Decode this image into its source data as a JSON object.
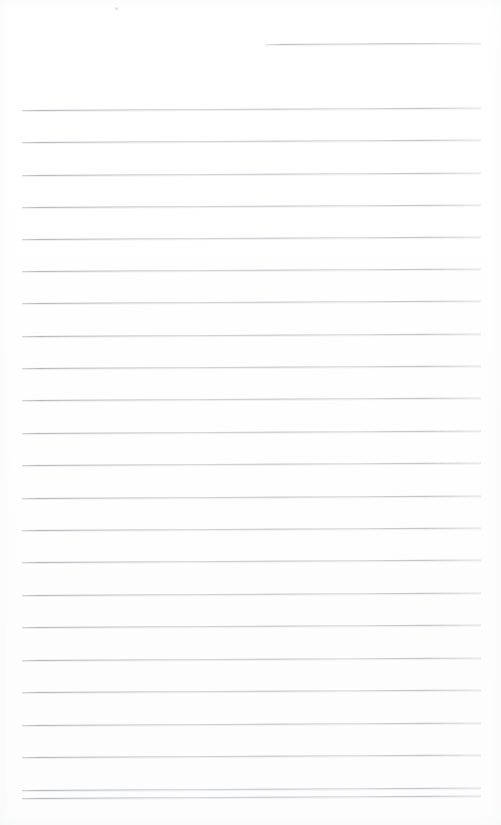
{
  "document": {
    "kind": "scanned-lined-notepad-page",
    "title": "Blank lined notepad page",
    "page_width": 501,
    "page_height": 825,
    "background_color": "#ffffff",
    "rule_color": "#b0b4ba",
    "rule_thickness": 1,
    "content_text": "",
    "is_blank": true,
    "line_count": 24,
    "line_spacing": 32.3,
    "left_margin_x": 22,
    "right_margin_x": 481,
    "skew_degrees": -0.32
  },
  "artifacts": {
    "speck": {
      "x": 115,
      "y": 7,
      "name": "scan-speck"
    }
  },
  "ruled_lines": [
    {
      "index": 1,
      "y": 44,
      "x_start": 265,
      "x_end": 481,
      "partial": true
    },
    {
      "index": 2,
      "y": 110,
      "x_start": 22,
      "x_end": 481,
      "partial": false
    },
    {
      "index": 3,
      "y": 142,
      "x_start": 22,
      "x_end": 481,
      "partial": false
    },
    {
      "index": 4,
      "y": 175,
      "x_start": 22,
      "x_end": 481,
      "partial": false
    },
    {
      "index": 5,
      "y": 207,
      "x_start": 22,
      "x_end": 481,
      "partial": false
    },
    {
      "index": 6,
      "y": 239,
      "x_start": 22,
      "x_end": 481,
      "partial": false
    },
    {
      "index": 7,
      "y": 271,
      "x_start": 22,
      "x_end": 481,
      "partial": false
    },
    {
      "index": 8,
      "y": 303,
      "x_start": 22,
      "x_end": 481,
      "partial": false
    },
    {
      "index": 9,
      "y": 336,
      "x_start": 22,
      "x_end": 481,
      "partial": false
    },
    {
      "index": 10,
      "y": 368,
      "x_start": 22,
      "x_end": 481,
      "partial": false
    },
    {
      "index": 11,
      "y": 400,
      "x_start": 22,
      "x_end": 481,
      "partial": false
    },
    {
      "index": 12,
      "y": 433,
      "x_start": 22,
      "x_end": 481,
      "partial": false
    },
    {
      "index": 13,
      "y": 465,
      "x_start": 22,
      "x_end": 481,
      "partial": false
    },
    {
      "index": 14,
      "y": 498,
      "x_start": 22,
      "x_end": 481,
      "partial": false
    },
    {
      "index": 15,
      "y": 530,
      "x_start": 22,
      "x_end": 481,
      "partial": false
    },
    {
      "index": 16,
      "y": 562,
      "x_start": 22,
      "x_end": 481,
      "partial": false
    },
    {
      "index": 17,
      "y": 595,
      "x_start": 22,
      "x_end": 481,
      "partial": false
    },
    {
      "index": 18,
      "y": 627,
      "x_start": 22,
      "x_end": 481,
      "partial": false
    },
    {
      "index": 19,
      "y": 660,
      "x_start": 22,
      "x_end": 481,
      "partial": false
    },
    {
      "index": 20,
      "y": 692,
      "x_start": 22,
      "x_end": 481,
      "partial": false
    },
    {
      "index": 21,
      "y": 725,
      "x_start": 22,
      "x_end": 481,
      "partial": false
    },
    {
      "index": 22,
      "y": 757,
      "x_start": 22,
      "x_end": 481,
      "partial": false
    },
    {
      "index": 23,
      "y": 790,
      "x_start": 22,
      "x_end": 481,
      "partial": false
    },
    {
      "index": 24,
      "y": 798,
      "x_start": 22,
      "x_end": 481,
      "partial": false
    }
  ]
}
